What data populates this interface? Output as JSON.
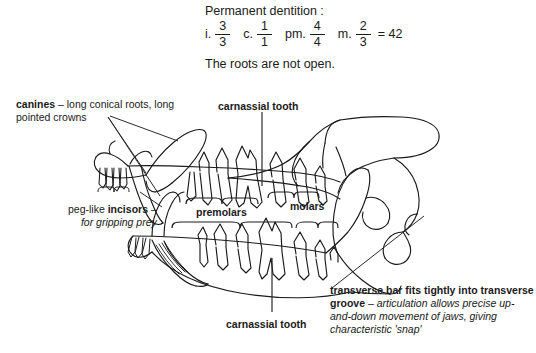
{
  "figure": {
    "header": {
      "title": "Permanent dentition :",
      "note": "The roots are not open."
    },
    "dental_formula": {
      "terms": [
        {
          "label": "i.",
          "numerator": "3",
          "denominator": "3"
        },
        {
          "label": "c.",
          "numerator": "1",
          "denominator": "1"
        },
        {
          "label": "pm.",
          "numerator": "4",
          "denominator": "4"
        },
        {
          "label": "m.",
          "numerator": "2",
          "denominator": "3"
        }
      ],
      "equals": "= 42"
    },
    "labels": {
      "canines": {
        "bold": "canines",
        "rest": " – long conical roots, long pointed crowns"
      },
      "carnassial_top": "carnassial tooth",
      "incisors": {
        "line1_plain": "peg-like ",
        "line1_bold": "incisors",
        "line1_tail": " –",
        "line2_italic": "for gripping prey"
      },
      "premolars": "premolars",
      "molars": "molars",
      "carnassial_bottom": "carnassial tooth",
      "transverse": {
        "bold": "transverse bar fits tightly into transverse groove",
        "dash": " – ",
        "italic": "articulation allows precise up-and-down movement of jaws, giving characteristic 'snap'"
      }
    },
    "colors": {
      "ink": "#1a1a1a",
      "background": "#ffffff",
      "leader": "#555555"
    }
  }
}
